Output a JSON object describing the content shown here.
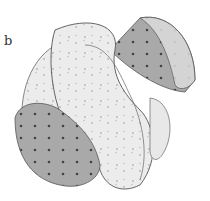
{
  "figure": {
    "panel_label": "b",
    "colors": {
      "background": "#ffffff",
      "dark_shade": "#8a8a8a",
      "mid_shade": "#b5b5b5",
      "light_shade": "#e6e6e6",
      "outline": "#555555"
    }
  }
}
